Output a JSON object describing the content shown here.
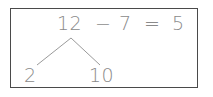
{
  "worksheet": {
    "background_color": "#ffffff",
    "border_color": "#4a4a4a",
    "text_color": "#8a8a8a",
    "line_color": "#9a9a9a"
  },
  "equation": {
    "minuend": "12",
    "operator": "−",
    "subtrahend": "7",
    "equals": "=",
    "result": "5",
    "full_text": "12 − 7 = 5"
  },
  "number_bond": {
    "whole": "12",
    "parts": [
      {
        "label": "2"
      },
      {
        "label": "10"
      }
    ]
  }
}
